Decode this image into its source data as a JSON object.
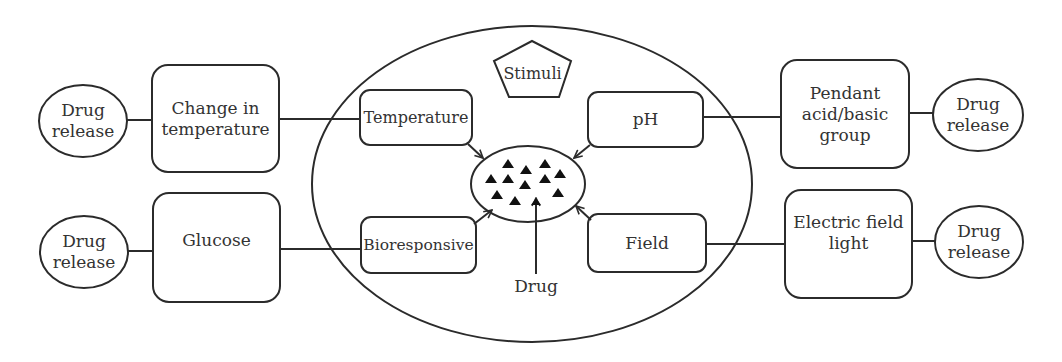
{
  "diagram": {
    "center": {
      "label": "Stimuli",
      "shape": "pentagon"
    },
    "drug_core": {
      "label": "Drug",
      "particle_count": 12
    },
    "stimuli": [
      {
        "id": "temperature",
        "label": "Temperature",
        "trigger": "Change in\ntemperature",
        "outcome": "Drug\nrelease"
      },
      {
        "id": "ph",
        "label": "pH",
        "trigger": "Pendant\nacid/basic\ngroup",
        "outcome": "Drug\nrelease"
      },
      {
        "id": "bioresponsive",
        "label": "Bioresponsive",
        "trigger": "Glucose",
        "outcome": "Drug\nrelease"
      },
      {
        "id": "field",
        "label": "Field",
        "trigger": "Electric field\nlight",
        "outcome": "Drug\nrelease"
      }
    ],
    "colors": {
      "stroke": "#2b2b2b",
      "background": "#ffffff",
      "particle": "#111111"
    }
  }
}
